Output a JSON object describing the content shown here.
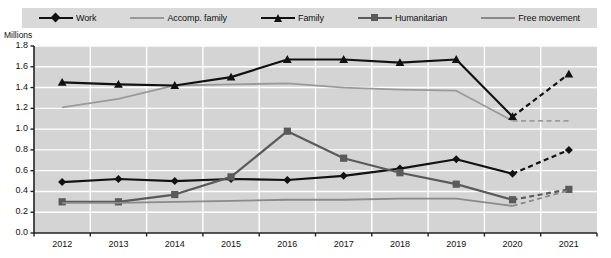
{
  "legend": {
    "items": [
      {
        "label": "Work",
        "marker": "diamond-marker",
        "color": "#111111"
      },
      {
        "label": "Accomp. family",
        "marker": "plain-line",
        "color": "#9a9a9a"
      },
      {
        "label": "Family",
        "marker": "triangle-marker",
        "color": "#111111"
      },
      {
        "label": "Humanitarian",
        "marker": "square-marker",
        "color": "#5a5a5a"
      },
      {
        "label": "Free movement",
        "marker": "plain-line",
        "color": "#8a8a8a"
      }
    ]
  },
  "axes": {
    "units_label": "Millions",
    "y_ticks": [
      "1.8",
      "1.6",
      "1.4",
      "1.2",
      "1.0",
      "0.8",
      "0.6",
      "0.4",
      "0.2",
      "0.0"
    ],
    "x_ticks": [
      "2012",
      "2013",
      "2014",
      "2015",
      "2016",
      "2017",
      "2018",
      "2019",
      "2020",
      "2021"
    ]
  },
  "chart_data": {
    "type": "line",
    "title": "",
    "xlabel": "",
    "ylabel": "Millions",
    "ylim": [
      0.0,
      1.8
    ],
    "ytick_step": 0.2,
    "grid": true,
    "legend_position": "top",
    "categories": [
      "2012",
      "2013",
      "2014",
      "2015",
      "2016",
      "2017",
      "2018",
      "2019",
      "2020",
      "2021"
    ],
    "dashed_from": "2020",
    "series": [
      {
        "name": "Work",
        "color": "#111111",
        "marker": "diamond",
        "values": [
          0.49,
          0.52,
          0.5,
          0.52,
          0.51,
          0.55,
          0.62,
          0.71,
          0.57,
          0.8
        ]
      },
      {
        "name": "Accomp. family",
        "color": "#9a9a9a",
        "marker": "none",
        "values": [
          1.21,
          1.29,
          1.42,
          1.43,
          1.44,
          1.4,
          1.38,
          1.37,
          1.08,
          1.08
        ]
      },
      {
        "name": "Family",
        "color": "#111111",
        "marker": "triangle",
        "values": [
          1.45,
          1.43,
          1.42,
          1.5,
          1.67,
          1.67,
          1.64,
          1.67,
          1.12,
          1.53
        ]
      },
      {
        "name": "Humanitarian",
        "color": "#5a5a5a",
        "marker": "square",
        "values": [
          0.3,
          0.3,
          0.37,
          0.54,
          0.98,
          0.72,
          0.58,
          0.47,
          0.32,
          0.42
        ]
      },
      {
        "name": "Free movement",
        "color": "#8a8a8a",
        "marker": "none",
        "values": [
          0.29,
          0.29,
          0.3,
          0.31,
          0.32,
          0.32,
          0.33,
          0.33,
          0.26,
          0.41
        ]
      }
    ]
  }
}
